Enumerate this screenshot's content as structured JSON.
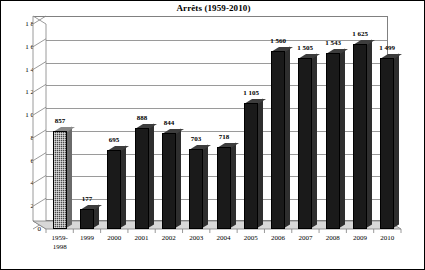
{
  "chart_data": {
    "type": "bar",
    "title": "Arrêts (1959-2010)",
    "xlabel": "",
    "ylabel": "",
    "ylim": [
      0,
      1800
    ],
    "ytick_step": 200,
    "grid": true,
    "legend": "none",
    "style": "3d-column",
    "number_format": "space-thousands-separator",
    "categories": [
      "1959-\n1998",
      "1999",
      "2000",
      "2001",
      "2002",
      "2003",
      "2004",
      "2005",
      "2006",
      "2007",
      "2008",
      "2009",
      "2010"
    ],
    "values": [
      857,
      177,
      695,
      888,
      844,
      703,
      718,
      1105,
      1560,
      1505,
      1543,
      1625,
      1499
    ],
    "data_labels": [
      "857",
      "177",
      "695",
      "888",
      "844",
      "703",
      "718",
      "1 105",
      "1 560",
      "1 505",
      "1 543",
      "1 625",
      "1 499"
    ],
    "ytick_labels": [
      "0",
      "200",
      "400",
      "600",
      "800",
      "1 000",
      "1 200",
      "1 400",
      "1 600",
      "1 800"
    ],
    "ytick_values": [
      0,
      200,
      400,
      600,
      800,
      1000,
      1200,
      1400,
      1600,
      1800
    ],
    "colors": {
      "bar_fill": "#1a1a1a",
      "bar_first_fill": "#4a4a4a",
      "bar_outline": "#000000",
      "plot_background": "#ffffff",
      "gridline": "#9a9a9a",
      "axis": "#808080",
      "frame": "#000000",
      "text": "#000000",
      "floor": "#d8d8d8"
    }
  }
}
